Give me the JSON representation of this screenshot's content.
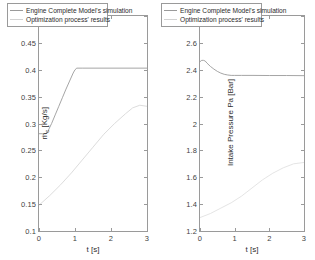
{
  "figure": {
    "background": "#ffffff",
    "axis_color": "#9a9a9a",
    "text_color": "#3f3f3f"
  },
  "legend": {
    "series1": "Engine Complete Model's simulation",
    "series2": "Optimization process' results",
    "color1": "#8f8f8f",
    "color2": "#c8c8c8"
  },
  "chart_data": [
    {
      "type": "line",
      "panel": "left",
      "title": "",
      "xlabel": "t [s]",
      "ylabel": "ṁc [Kg/s]",
      "xlim": [
        0,
        3
      ],
      "ylim": [
        0.1,
        0.5
      ],
      "xticks": [
        0,
        1,
        2,
        3
      ],
      "xticklabels": [
        "0",
        "1",
        "2",
        "3"
      ],
      "yticks": [
        0.1,
        0.15,
        0.2,
        0.25,
        0.3,
        0.35,
        0.4,
        0.45,
        0.5
      ],
      "yticklabels": [
        "0.1",
        "0.15",
        "0.2",
        "0.25",
        "0.3",
        "0.35",
        "0.4",
        "0.45",
        "0.5"
      ],
      "grid": false,
      "legend_position": "top",
      "series": [
        {
          "name": "Engine Complete Model's simulation",
          "color": "#9a9a9a",
          "x": [
            0,
            0.1,
            0.2,
            0.25,
            0.35,
            0.45,
            0.55,
            0.65,
            0.75,
            0.85,
            0.95,
            1.0,
            1.05,
            1.2,
            1.5,
            2.0,
            2.5,
            3.0
          ],
          "y": [
            0.281,
            0.281,
            0.281,
            0.286,
            0.3,
            0.316,
            0.332,
            0.348,
            0.364,
            0.379,
            0.394,
            0.4,
            0.403,
            0.403,
            0.403,
            0.403,
            0.403,
            0.403
          ]
        },
        {
          "name": "Optimization process' results",
          "color": "#d8d8d8",
          "x": [
            0,
            0.3,
            0.6,
            0.9,
            1.2,
            1.5,
            1.8,
            2.1,
            2.4,
            2.6,
            2.8,
            3.0
          ],
          "y": [
            0.148,
            0.166,
            0.186,
            0.208,
            0.232,
            0.256,
            0.28,
            0.3,
            0.318,
            0.329,
            0.334,
            0.332
          ]
        }
      ]
    },
    {
      "type": "line",
      "panel": "right",
      "title": "",
      "xlabel": "t [s]",
      "ylabel": "Intake Pressure Pa [Bar]",
      "xlim": [
        0,
        3
      ],
      "ylim": [
        1.2,
        2.8
      ],
      "xticks": [
        0,
        1,
        2,
        3
      ],
      "xticklabels": [
        "0",
        "1",
        "2",
        "3"
      ],
      "yticks": [
        1.2,
        1.4,
        1.6,
        1.8,
        2.0,
        2.2,
        2.4,
        2.6,
        2.8
      ],
      "yticklabels": [
        "1.2",
        "1.4",
        "1.6",
        "1.8",
        "2",
        "2.2",
        "2.4",
        "2.6",
        "2.8"
      ],
      "grid": false,
      "legend_position": "top",
      "series": [
        {
          "name": "Engine Complete Model's simulation",
          "color": "#9a9a9a",
          "x": [
            0,
            0.05,
            0.1,
            0.15,
            0.2,
            0.3,
            0.4,
            0.5,
            0.6,
            0.7,
            0.8,
            0.9,
            1.0,
            1.2,
            1.5,
            2.0,
            2.5,
            3.0
          ],
          "y": [
            2.46,
            2.47,
            2.47,
            2.465,
            2.45,
            2.425,
            2.405,
            2.388,
            2.375,
            2.366,
            2.361,
            2.358,
            2.358,
            2.358,
            2.358,
            2.357,
            2.357,
            2.356
          ]
        },
        {
          "name": "Optimization process' results",
          "color": "#e0e0e0",
          "x": [
            0,
            0.3,
            0.6,
            0.9,
            1.2,
            1.5,
            1.8,
            2.1,
            2.4,
            2.7,
            3.0
          ],
          "y": [
            1.3,
            1.33,
            1.37,
            1.41,
            1.46,
            1.52,
            1.58,
            1.63,
            1.67,
            1.7,
            1.71
          ]
        }
      ]
    }
  ]
}
